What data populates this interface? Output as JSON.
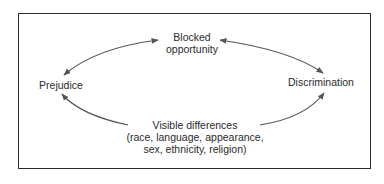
{
  "diagram": {
    "nodes": {
      "top": {
        "line1": "Blocked",
        "line2": "opportunity"
      },
      "left": {
        "label": "Prejudice"
      },
      "right": {
        "label": "Discrimination"
      },
      "bottom": {
        "line1": "Visible differences",
        "line2": "(race, language, appearance,",
        "line3": "sex, ethnicity, religion)"
      }
    },
    "edges": [
      {
        "from": "Blocked opportunity",
        "to": "Prejudice",
        "direction": "bidirectional"
      },
      {
        "from": "Blocked opportunity",
        "to": "Discrimination",
        "direction": "bidirectional"
      },
      {
        "from": "Visible differences",
        "to": "Prejudice",
        "direction": "forward"
      },
      {
        "from": "Visible differences",
        "to": "Discrimination",
        "direction": "forward"
      }
    ],
    "colors": {
      "border": "#2b2b2b",
      "arrow": "#555555",
      "text": "#2a2a2a"
    }
  }
}
